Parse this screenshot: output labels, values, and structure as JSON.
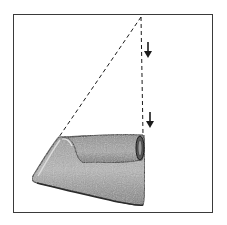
{
  "figure": {
    "frame": {
      "x": 13,
      "y": 14,
      "width": 200,
      "height": 199
    },
    "colors": {
      "background": "#ffffff",
      "frame_stroke": "#3a3a3a",
      "ink": "#1a1a1a",
      "fabric_light": "#b5b5b5",
      "fabric_mid": "#8a8a8a",
      "fabric_dark": "#4a4a4a"
    },
    "apex": {
      "x": 141,
      "y": 17
    },
    "guide_lines": [
      {
        "name": "diagonal",
        "from": [
          141,
          17
        ],
        "to": [
          59,
          137
        ],
        "style": "dashed"
      },
      {
        "name": "vertical",
        "from": [
          141,
          17
        ],
        "to": [
          143,
          135
        ],
        "style": "dashed"
      }
    ],
    "arrows": [
      {
        "direction": "down",
        "x": 148,
        "y_top": 42,
        "y_bottom": 58
      },
      {
        "direction": "down",
        "x": 150,
        "y_top": 112,
        "y_bottom": 128
      }
    ],
    "objects": [
      "folded-fabric"
    ]
  }
}
